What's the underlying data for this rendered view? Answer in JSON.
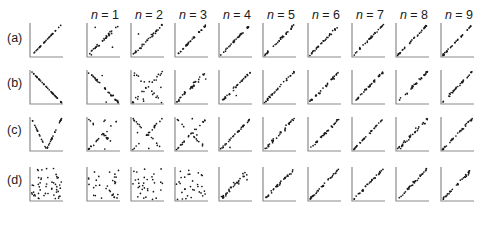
{
  "figure": {
    "row_labels": [
      "(a)",
      "(b)",
      "(c)",
      "(d)"
    ],
    "column_labels": [
      "n = 1",
      "n = 2",
      "n = 3",
      "n = 4",
      "n = 5",
      "n = 6",
      "n = 7",
      "n = 8",
      "n = 9"
    ],
    "colors": {
      "points": "#1a1a1a",
      "axes": "#8a8a8a",
      "text": "#1a1a1a",
      "background": "#ffffff"
    }
  },
  "chart_data": {
    "type": "scatter",
    "title": "",
    "xlabel": "",
    "ylabel": "",
    "axis_ticks": "none",
    "grid": false,
    "rows": [
      {
        "label": "(a)",
        "original": {
          "pattern": "line_increasing",
          "points": 30,
          "noise": 0.0
        },
        "columns": [
          {
            "n": 1,
            "pattern": "line_increasing",
            "noise": 0.1,
            "outliers": 2
          },
          {
            "n": 2,
            "pattern": "line_increasing",
            "noise": 0.07,
            "outliers": 1
          },
          {
            "n": 3,
            "pattern": "line_increasing",
            "noise": 0.04,
            "outliers": 0
          },
          {
            "n": 4,
            "pattern": "line_increasing",
            "noise": 0.05,
            "outliers": 0
          },
          {
            "n": 5,
            "pattern": "line_increasing",
            "noise": 0.06,
            "outliers": 0
          },
          {
            "n": 6,
            "pattern": "line_increasing",
            "noise": 0.05,
            "outliers": 0
          },
          {
            "n": 7,
            "pattern": "line_increasing",
            "noise": 0.06,
            "outliers": 0
          },
          {
            "n": 8,
            "pattern": "line_increasing",
            "noise": 0.05,
            "outliers": 0
          },
          {
            "n": 9,
            "pattern": "line_increasing",
            "noise": 0.04,
            "outliers": 0
          }
        ]
      },
      {
        "label": "(b)",
        "original": {
          "pattern": "line_decreasing",
          "points": 40,
          "noise": 0.0
        },
        "columns": [
          {
            "n": 1,
            "pattern": "line_decreasing",
            "noise": 0.07,
            "outliers": 3
          },
          {
            "n": 2,
            "pattern": "cross",
            "noise": 0.1,
            "outliers": 4
          },
          {
            "n": 3,
            "pattern": "line_increasing",
            "noise": 0.1,
            "outliers": 2
          },
          {
            "n": 4,
            "pattern": "line_increasing",
            "noise": 0.08,
            "outliers": 1
          },
          {
            "n": 5,
            "pattern": "line_increasing",
            "noise": 0.06,
            "outliers": 0
          },
          {
            "n": 6,
            "pattern": "line_increasing",
            "noise": 0.07,
            "outliers": 0
          },
          {
            "n": 7,
            "pattern": "line_increasing",
            "noise": 0.06,
            "outliers": 0
          },
          {
            "n": 8,
            "pattern": "line_increasing",
            "noise": 0.07,
            "outliers": 0
          },
          {
            "n": 9,
            "pattern": "line_increasing",
            "noise": 0.08,
            "outliers": 0
          }
        ]
      },
      {
        "label": "(c)",
        "original": {
          "pattern": "v_shape",
          "points": 40,
          "noise": 0.0
        },
        "columns": [
          {
            "n": 1,
            "pattern": "cross",
            "noise": 0.08,
            "outliers": 3
          },
          {
            "n": 2,
            "pattern": "cross",
            "noise": 0.07,
            "outliers": 2
          },
          {
            "n": 3,
            "pattern": "cross",
            "noise": 0.06,
            "outliers": 2
          },
          {
            "n": 4,
            "pattern": "line_increasing",
            "noise": 0.05,
            "outliers": 1
          },
          {
            "n": 5,
            "pattern": "line_increasing",
            "noise": 0.09,
            "outliers": 0
          },
          {
            "n": 6,
            "pattern": "line_increasing",
            "noise": 0.07,
            "outliers": 0
          },
          {
            "n": 7,
            "pattern": "line_increasing",
            "noise": 0.05,
            "outliers": 0
          },
          {
            "n": 8,
            "pattern": "line_increasing",
            "noise": 0.1,
            "outliers": 0
          },
          {
            "n": 9,
            "pattern": "line_increasing",
            "noise": 0.06,
            "outliers": 0
          }
        ]
      },
      {
        "label": "(d)",
        "original": {
          "pattern": "random",
          "points": 50,
          "noise": 1.0
        },
        "columns": [
          {
            "n": 1,
            "pattern": "random",
            "noise": 1.0,
            "outliers": 0
          },
          {
            "n": 2,
            "pattern": "random",
            "noise": 1.0,
            "outliers": 0
          },
          {
            "n": 3,
            "pattern": "random",
            "noise": 1.0,
            "outliers": 0
          },
          {
            "n": 4,
            "pattern": "line_increasing",
            "noise": 0.12,
            "outliers": 3
          },
          {
            "n": 5,
            "pattern": "line_increasing",
            "noise": 0.08,
            "outliers": 0
          },
          {
            "n": 6,
            "pattern": "line_increasing",
            "noise": 0.07,
            "outliers": 0
          },
          {
            "n": 7,
            "pattern": "line_increasing",
            "noise": 0.06,
            "outliers": 0
          },
          {
            "n": 8,
            "pattern": "line_increasing",
            "noise": 0.08,
            "outliers": 0
          },
          {
            "n": 9,
            "pattern": "line_increasing",
            "noise": 0.08,
            "outliers": 0
          }
        ]
      }
    ],
    "layout": {
      "orig_left": 30,
      "col_lefts": [
        87,
        131,
        175,
        219,
        263,
        308,
        352,
        396,
        441
      ],
      "row_tops": [
        23,
        70,
        117,
        167
      ],
      "panel_width": 33,
      "panel_height": 34
    }
  }
}
